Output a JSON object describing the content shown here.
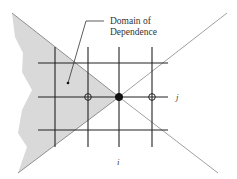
{
  "diagram": {
    "title": "Domain of Dependence",
    "annotation": {
      "line1": "Domain of",
      "line2": "Dependence"
    },
    "axis_labels": {
      "row": "j",
      "column": "i"
    },
    "colors": {
      "shade": "#d9d9d9",
      "grid": "#222222",
      "characteristic": "#888888",
      "text": "#333333"
    },
    "nodes": [
      {
        "name": "center-node",
        "type": "filled"
      },
      {
        "name": "left-neighbor-node",
        "type": "open"
      },
      {
        "name": "right-neighbor-node",
        "type": "open"
      }
    ]
  }
}
